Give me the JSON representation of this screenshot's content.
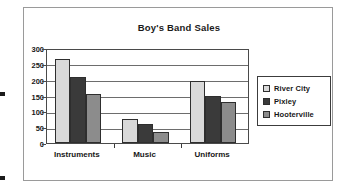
{
  "frame": {
    "edge_marks": [
      {
        "x": 0,
        "y": 92
      },
      {
        "x": 0,
        "y": 176
      }
    ]
  },
  "chart_data": {
    "type": "bar",
    "title": "Boy's Band Sales",
    "xlabel": "",
    "ylabel": "",
    "categories": [
      "Instruments",
      "Music",
      "Uniforms"
    ],
    "series": [
      {
        "name": "River City",
        "color": "#d9d9d9",
        "values": [
          265,
          75,
          197
        ]
      },
      {
        "name": "Pixley",
        "color": "#3a3a3a",
        "values": [
          210,
          60,
          150
        ]
      },
      {
        "name": "Hooterville",
        "color": "#8c8c8c",
        "values": [
          155,
          35,
          128
        ]
      }
    ],
    "ylim": [
      0,
      300
    ],
    "yticks": [
      0,
      50,
      100,
      150,
      200,
      250,
      300
    ],
    "ytick_labels": [
      "0",
      "50",
      "100",
      "150",
      "200",
      "250",
      "300"
    ],
    "grid": true,
    "legend_position": "right"
  }
}
